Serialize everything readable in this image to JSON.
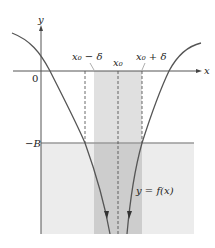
{
  "diagram": {
    "title": "",
    "axes": {
      "x_label": "x",
      "y_label": "y",
      "origin_label": "0"
    },
    "labels": {
      "x0_minus_delta": "x₀ − δ",
      "x0": "x₀",
      "x0_plus_delta": "x₀ + δ",
      "neg_B": "−B",
      "function": "y = f(x)"
    },
    "colors": {
      "axis": "#555555",
      "curve": "#555555",
      "light_shade": "#ebebeb",
      "band_shade": "#dcdcdc",
      "overlap_shade": "#c8c8c8",
      "b_line": "#9a9a9a",
      "dashed": "#444444"
    }
  }
}
